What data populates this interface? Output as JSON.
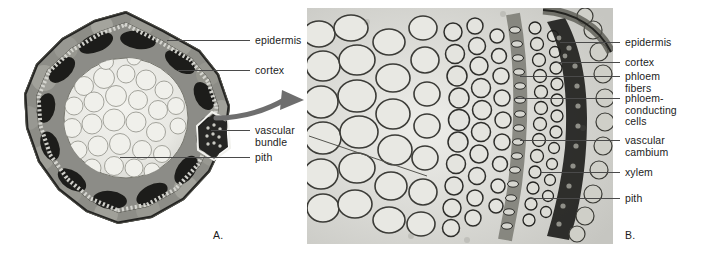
{
  "figure": {
    "panels": [
      {
        "letter": "A.",
        "name": "whole-stem-cross-section",
        "labels": [
          {
            "text": "epidermis",
            "id": "epidermis"
          },
          {
            "text": "cortex",
            "id": "cortex"
          },
          {
            "text": "vascular\nbundle",
            "id": "vascular-bundle"
          },
          {
            "text": "pith",
            "id": "pith"
          }
        ]
      },
      {
        "letter": "B.",
        "name": "vascular-bundle-detail-micrograph",
        "labels": [
          {
            "text": "epidermis",
            "id": "epidermis"
          },
          {
            "text": "cortex",
            "id": "cortex"
          },
          {
            "text": "phloem\nfibers",
            "id": "phloem-fibers"
          },
          {
            "text": "phloem-\nconducting\ncells",
            "id": "phloem-conducting-cells"
          },
          {
            "text": "vascular\ncambium",
            "id": "vascular-cambium"
          },
          {
            "text": "xylem",
            "id": "xylem"
          },
          {
            "text": "pith",
            "id": "pith"
          }
        ]
      }
    ],
    "colors": {
      "background": "#ffffff",
      "text": "#1c1c1c",
      "leader_line": "#4a4a4a",
      "arrow": "#6e6e6e",
      "micrograph_tint": "#cfcfcb",
      "tissue_dark": "#2a2a28",
      "tissue_mid": "#8a8a86",
      "tissue_light": "#e6e6e2"
    }
  }
}
